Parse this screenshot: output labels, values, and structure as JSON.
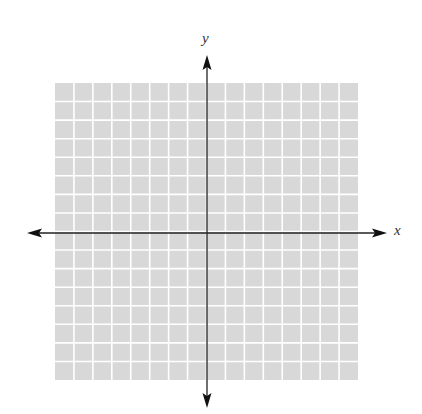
{
  "diagram": {
    "type": "coordinate-plane",
    "grid": {
      "columns": 16,
      "rows": 16,
      "fill": "#d8d8d8",
      "line_color": "#ffffff"
    },
    "axes": {
      "x_label": "x",
      "y_label": "y",
      "color": "#222222",
      "arrows": "both-directions"
    }
  }
}
